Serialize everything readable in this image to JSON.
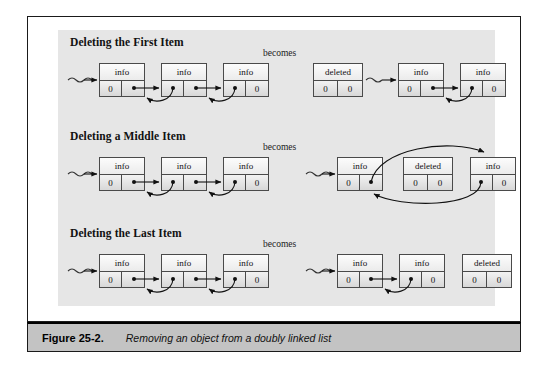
{
  "figure": {
    "caption_label": "Figure 25-2.",
    "caption_text": "Removing an object from a doubly linked list",
    "frame_color": "#1a1a1a",
    "panel_color": "#e6e6e6",
    "caption_bar_color": "#c3c3c3"
  },
  "labels": {
    "becomes": "becomes",
    "info": "info",
    "deleted": "deleted",
    "null_value": "0"
  },
  "sections": [
    {
      "id": "first",
      "title": "Deleting the First Item",
      "becomes": "becomes",
      "before": {
        "nodes": [
          {
            "top": "info",
            "left": "0",
            "right": ""
          },
          {
            "top": "info",
            "left": "",
            "right": ""
          },
          {
            "top": "info",
            "left": "",
            "right": "0"
          }
        ],
        "has_head_pointer": true
      },
      "after": {
        "nodes": [
          {
            "top": "deleted",
            "left": "0",
            "right": "0"
          },
          {
            "top": "info",
            "left": "0",
            "right": ""
          },
          {
            "top": "info",
            "left": "",
            "right": "0"
          }
        ],
        "has_head_pointer": true
      }
    },
    {
      "id": "middle",
      "title": "Deleting a Middle Item",
      "becomes": "becomes",
      "before": {
        "nodes": [
          {
            "top": "info",
            "left": "0",
            "right": ""
          },
          {
            "top": "info",
            "left": "",
            "right": ""
          },
          {
            "top": "info",
            "left": "",
            "right": "0"
          }
        ],
        "has_head_pointer": true
      },
      "after": {
        "nodes": [
          {
            "top": "info",
            "left": "0",
            "right": ""
          },
          {
            "top": "deleted",
            "left": "0",
            "right": "0"
          },
          {
            "top": "info",
            "left": "",
            "right": "0"
          }
        ],
        "has_head_pointer": true
      }
    },
    {
      "id": "last",
      "title": "Deleting the Last Item",
      "becomes": "becomes",
      "before": {
        "nodes": [
          {
            "top": "info",
            "left": "0",
            "right": ""
          },
          {
            "top": "info",
            "left": "",
            "right": ""
          },
          {
            "top": "info",
            "left": "",
            "right": "0"
          }
        ],
        "has_head_pointer": true
      },
      "after": {
        "nodes": [
          {
            "top": "info",
            "left": "0",
            "right": ""
          },
          {
            "top": "info",
            "left": "",
            "right": "0"
          },
          {
            "top": "deleted",
            "left": "0",
            "right": "0"
          }
        ],
        "has_head_pointer": true
      }
    }
  ]
}
